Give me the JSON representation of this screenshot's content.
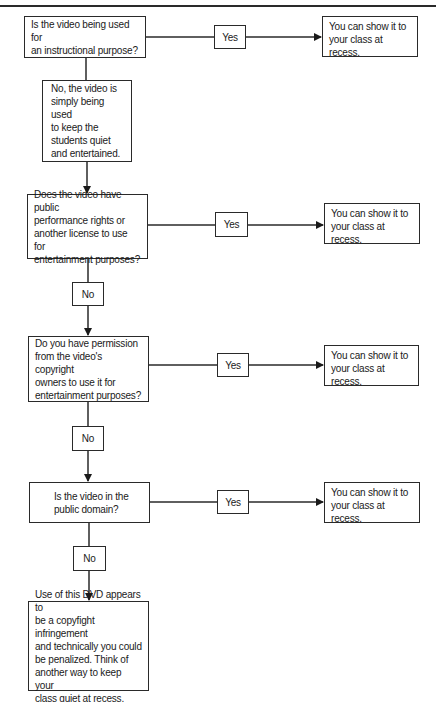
{
  "diagram": {
    "type": "flowchart",
    "nodes": [
      {
        "id": "q1",
        "text": "Is the video being used for\nan instructional purpose?"
      },
      {
        "id": "n1",
        "text": "No, the video is\nsimply being used\nto keep the\nstudents quiet\nand entertained."
      },
      {
        "id": "q2",
        "text": "Does the video have public\nperformance rights or\nanother license to use for\nentertainment purposes?"
      },
      {
        "id": "q3",
        "text": "Do you have permission\nfrom the video's copyright\nowners to use it for\nentertainment purposes?"
      },
      {
        "id": "q4",
        "text": "Is the video in the\npublic domain?"
      },
      {
        "id": "end",
        "text": "Use of this DVD appears to\nbe a copyfight infringement\nand technically you could\nbe penalized. Think of\nanother way to keep your\nclass quiet at recess."
      }
    ],
    "outcomes": [
      {
        "id": "o1",
        "text": "You can show it to\nyour class at recess."
      },
      {
        "id": "o2",
        "text": "You can show it to\nyour class at recess."
      },
      {
        "id": "o3",
        "text": "You can show it to\nyour class at recess."
      },
      {
        "id": "o4",
        "text": "You can show it to\nyour class at recess."
      }
    ],
    "labels": {
      "yes": "Yes",
      "no": "No"
    },
    "edges": [
      {
        "from": "q1",
        "to": "o1",
        "label": "Yes"
      },
      {
        "from": "q1",
        "to": "n1",
        "label": ""
      },
      {
        "from": "n1",
        "to": "q2",
        "label": ""
      },
      {
        "from": "q2",
        "to": "o2",
        "label": "Yes"
      },
      {
        "from": "q2",
        "to": "q3",
        "label": "No"
      },
      {
        "from": "q3",
        "to": "o3",
        "label": "Yes"
      },
      {
        "from": "q3",
        "to": "q4",
        "label": "No"
      },
      {
        "from": "q4",
        "to": "o4",
        "label": "Yes"
      },
      {
        "from": "q4",
        "to": "end",
        "label": "No"
      }
    ]
  }
}
